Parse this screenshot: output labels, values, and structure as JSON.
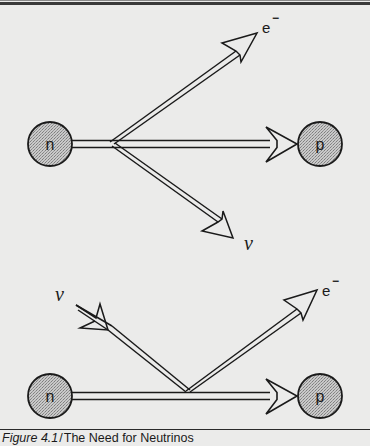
{
  "figure": {
    "caption_number": "Figure 4.1",
    "caption_separator": "/",
    "caption_title": "The Need for Neutrinos",
    "colors": {
      "background": "#ebebea",
      "ink": "#1a1a1a",
      "particle_fill": "#b8b8b8"
    },
    "diagrams": [
      {
        "id": "top",
        "description": "Neutron decays into proton, electron and neutrino",
        "particles": [
          {
            "label": "n",
            "cx": 50,
            "cy": 144,
            "r": 22
          },
          {
            "label": "p",
            "cx": 320,
            "cy": 144,
            "r": 22
          }
        ],
        "outgoing_labels": [
          {
            "label": "e",
            "superscript": "−",
            "x": 262,
            "y": 33
          },
          {
            "label": "ν",
            "x": 244,
            "y": 250
          }
        ]
      },
      {
        "id": "bottom",
        "description": "Neutrino absorbed by neutron producing proton and electron",
        "particles": [
          {
            "label": "n",
            "cx": 50,
            "cy": 396,
            "r": 22
          },
          {
            "label": "p",
            "cx": 320,
            "cy": 396,
            "r": 22
          }
        ],
        "incoming_labels": [
          {
            "label": "ν",
            "x": 55,
            "y": 301
          }
        ],
        "outgoing_labels": [
          {
            "label": "e",
            "superscript": "−",
            "x": 322,
            "y": 296
          }
        ]
      }
    ]
  }
}
